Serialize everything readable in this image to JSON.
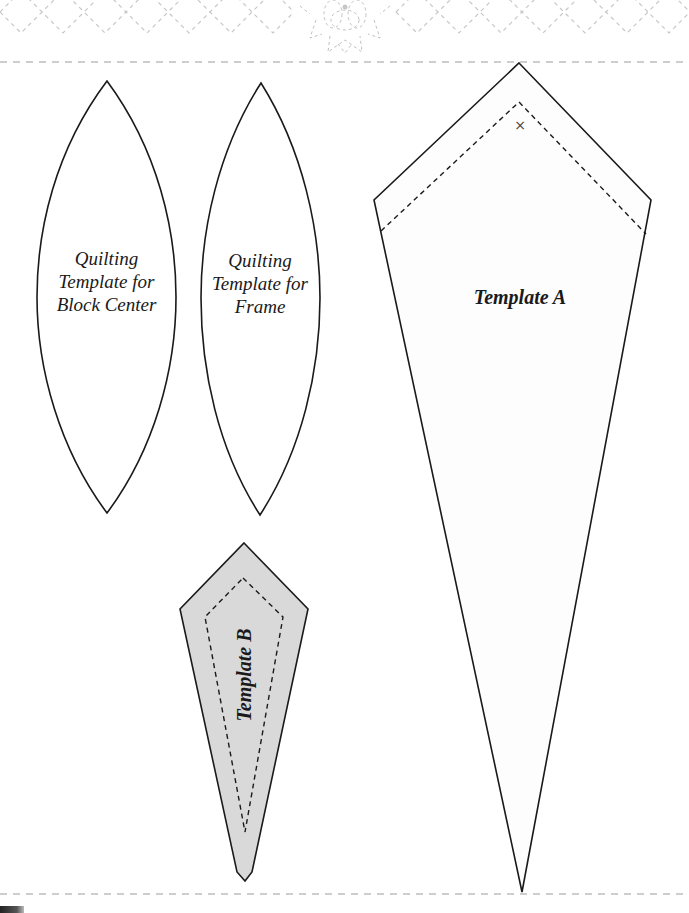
{
  "page": {
    "background": "#ffffff",
    "header_pattern_color": "#c8c8c8",
    "cut_line_color": "#bdbdbd",
    "outline_color": "#1a1a1a",
    "template_b_fill": "#d9d9d9"
  },
  "header": {
    "decoration": "dashed-diamond-lattice-with-flower-motif"
  },
  "templates": {
    "quilting_block_center": {
      "line1": "Quilting",
      "line2": "Template for",
      "line3": "Block Center"
    },
    "quilting_frame": {
      "line1": "Quilting",
      "line2": "Template for",
      "line3": "Frame"
    },
    "template_a": {
      "label": "Template A",
      "mark": "×"
    },
    "template_b": {
      "label": "Template B"
    }
  }
}
